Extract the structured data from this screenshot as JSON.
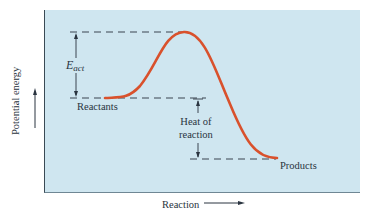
{
  "diagram": {
    "y_axis_label": "Potential energy",
    "x_axis_label": "Reaction",
    "labels": {
      "eact_main": "E",
      "eact_sub": "act",
      "reactants": "Reactants",
      "products": "Products",
      "heat_line1": "Heat of",
      "heat_line2": "reaction"
    },
    "colors": {
      "panel_bg": "#cfe6f0",
      "curve": "#d9512c",
      "lines": "#2a3440"
    },
    "levels": {
      "transition_state_y": 32,
      "reactants_y": 98,
      "products_y": 159
    }
  }
}
